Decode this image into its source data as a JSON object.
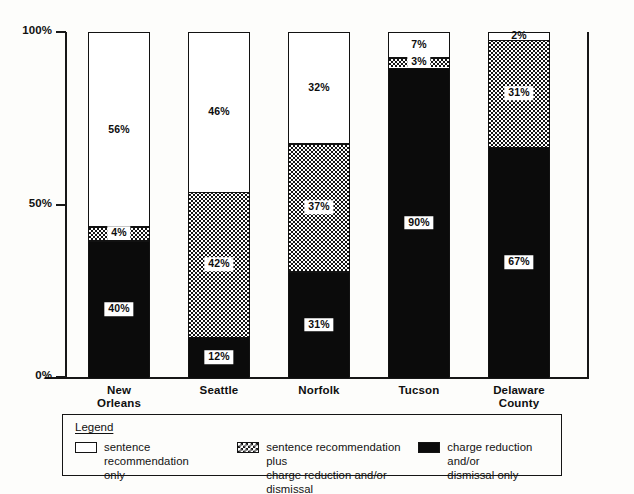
{
  "chart_data": {
    "type": "bar",
    "subtype": "stacked-100-percent-vertical",
    "title": "",
    "xlabel": "",
    "ylabel": "",
    "ylim": [
      0,
      100
    ],
    "yticks": [
      "0%",
      "50%",
      "100%"
    ],
    "ytick_values": [
      0,
      50,
      100
    ],
    "grid": false,
    "legend_position": "bottom",
    "categories": [
      "New Orleans",
      "Seattle",
      "Norfolk",
      "Tucson",
      "Delaware County"
    ],
    "series": [
      {
        "name": "sentence recommendation only",
        "fill": "white",
        "values": [
          56,
          46,
          32,
          7,
          2
        ],
        "labels": [
          "56%",
          "46%",
          "32%",
          "7%",
          "2%"
        ]
      },
      {
        "name": "sentence recommendation plus charge reduction and/or dismissal",
        "fill": "checkered",
        "values": [
          4,
          42,
          37,
          3,
          31
        ],
        "labels": [
          "4%",
          "42%",
          "37%",
          "3%",
          "31%"
        ]
      },
      {
        "name": "charge reduction and/or dismissal only",
        "fill": "black",
        "values": [
          40,
          12,
          31,
          90,
          67
        ],
        "labels": [
          "40%",
          "12%",
          "31%",
          "90%",
          "67%"
        ]
      }
    ]
  },
  "axis": {
    "y_ticks": [
      {
        "label": "100%",
        "value": 100
      },
      {
        "label": "50%",
        "value": 50
      },
      {
        "label": "0%",
        "value": 0
      }
    ]
  },
  "categories": [
    {
      "line1": "New",
      "line2": "Orleans"
    },
    {
      "line1": "Seattle",
      "line2": ""
    },
    {
      "line1": "Norfolk",
      "line2": ""
    },
    {
      "line1": "Tucson",
      "line2": ""
    },
    {
      "line1": "Delaware",
      "line2": "County"
    }
  ],
  "legend": {
    "title": "Legend",
    "items": [
      {
        "swatch": "white",
        "line1": "sentence recommendation",
        "line2": "only"
      },
      {
        "swatch": "checkered",
        "line1": "sentence recommendation plus",
        "line2": "charge reduction and/or dismissal"
      },
      {
        "swatch": "black",
        "line1": "charge reduction and/or",
        "line2": "dismissal only"
      }
    ]
  },
  "colors": {
    "ink": "#111111",
    "paper": "#fdfdfb",
    "segment_black": "#0b0b0b",
    "segment_white": "#ffffff"
  }
}
